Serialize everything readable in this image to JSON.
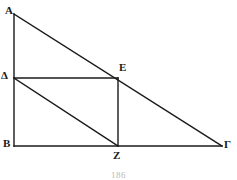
{
  "figure": {
    "kind": "euclidean-geometry-diagram",
    "background_color": "#ffffff",
    "line_color": "#1a1a1a",
    "label_color": "#1a1a1a",
    "vertices": [
      {
        "name": "A",
        "label": "A",
        "x": 14,
        "y": 14
      },
      {
        "name": "B",
        "label": "B",
        "x": 14,
        "y": 146
      },
      {
        "name": "G",
        "label": "Γ",
        "x": 222,
        "y": 146
      },
      {
        "name": "D",
        "label": "Δ",
        "x": 14,
        "y": 78
      },
      {
        "name": "E",
        "label": "E",
        "x": 118,
        "y": 78
      },
      {
        "name": "Z",
        "label": "Z",
        "x": 118,
        "y": 146
      }
    ],
    "segments": [
      {
        "name": "side-AB",
        "from": "A",
        "to": "B"
      },
      {
        "name": "side-BG",
        "from": "B",
        "to": "G"
      },
      {
        "name": "hypotenuse-AG",
        "from": "A",
        "to": "G"
      },
      {
        "name": "segment-DE",
        "from": "D",
        "to": "E"
      },
      {
        "name": "segment-EZ",
        "from": "E",
        "to": "Z"
      },
      {
        "name": "diagonal-DZ",
        "from": "D",
        "to": "Z"
      }
    ]
  },
  "page": {
    "number": "186"
  }
}
